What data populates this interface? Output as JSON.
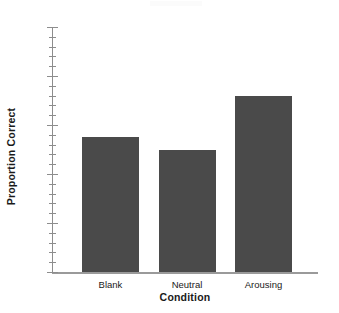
{
  "chart_data": {
    "type": "bar",
    "title": "",
    "xlabel": "Condition",
    "ylabel": "Proportion Correct",
    "categories": [
      "Blank",
      "Neutral",
      "Arousing"
    ],
    "values": [
      0.475,
      0.45,
      0.56
    ],
    "ylim": [
      0.2,
      0.7
    ],
    "ytick_labels": [
      ".2",
      ".3",
      ".4",
      ".5",
      ".6",
      ".7"
    ],
    "ytick_values": [
      0.2,
      0.3,
      0.4,
      0.5,
      0.6,
      0.7
    ],
    "yminor_step": 0.02,
    "grid": false,
    "legend": false,
    "bar_color": "#4a4a4a",
    "axis_color": "#8d8d8d",
    "background": "#ffffff"
  }
}
